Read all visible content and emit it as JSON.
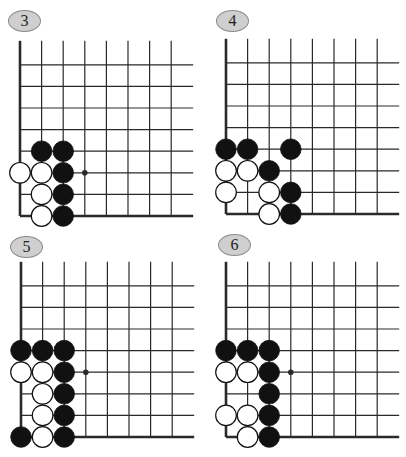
{
  "figure": {
    "grid": {
      "cols": 8,
      "rows": 8,
      "spacing": 21.6
    },
    "colors": {
      "line": "#2a2a2a",
      "badge_fill": "#cfcfcf",
      "badge_border": "#8a8a8a",
      "black_stone": "#111111",
      "white_stone": "#ffffff"
    },
    "boards": [
      {
        "label": "3",
        "origin": {
          "x": 20,
          "y": 216
        },
        "badge": {
          "x": 8,
          "y": 10
        },
        "star_points": [
          [
            3,
            2
          ]
        ],
        "stones": [
          {
            "c": 1,
            "r": 3,
            "color": "black"
          },
          {
            "c": 2,
            "r": 3,
            "color": "black"
          },
          {
            "c": 0,
            "r": 2,
            "color": "white"
          },
          {
            "c": 1,
            "r": 2,
            "color": "white"
          },
          {
            "c": 2,
            "r": 2,
            "color": "black"
          },
          {
            "c": 1,
            "r": 1,
            "color": "white"
          },
          {
            "c": 2,
            "r": 1,
            "color": "black"
          },
          {
            "c": 1,
            "r": 0.06,
            "color": "white",
            "rr": 1
          },
          {
            "c": 2,
            "r": 0.06,
            "color": "black",
            "rr": 1
          },
          {
            "c": 1,
            "r": 0,
            "color": "white"
          },
          {
            "c": 2,
            "r": 0,
            "color": "black"
          }
        ]
      },
      {
        "label": "4",
        "origin": {
          "x": 226,
          "y": 214
        },
        "badge": {
          "x": 216,
          "y": 10
        },
        "star_points": [],
        "stones": [
          {
            "c": 0,
            "r": 3,
            "color": "black"
          },
          {
            "c": 1,
            "r": 3,
            "color": "black"
          },
          {
            "c": 3,
            "r": 3,
            "color": "black"
          },
          {
            "c": 0,
            "r": 2,
            "color": "white"
          },
          {
            "c": 1,
            "r": 2,
            "color": "white"
          },
          {
            "c": 2,
            "r": 2,
            "color": "black"
          },
          {
            "c": 0,
            "r": 1,
            "color": "white"
          },
          {
            "c": 2,
            "r": 1,
            "color": "white"
          },
          {
            "c": 3,
            "r": 1,
            "color": "black"
          },
          {
            "c": 2,
            "r": 0,
            "color": "white"
          },
          {
            "c": 3,
            "r": 0,
            "color": "black"
          }
        ]
      },
      {
        "label": "5",
        "origin": {
          "x": 21,
          "y": 437
        },
        "badge": {
          "x": 10,
          "y": 236
        },
        "star_points": [
          [
            3,
            3
          ]
        ],
        "stones": [
          {
            "c": 0,
            "r": 4,
            "color": "black"
          },
          {
            "c": 1,
            "r": 4,
            "color": "black"
          },
          {
            "c": 2,
            "r": 4,
            "color": "black"
          },
          {
            "c": 0,
            "r": 3,
            "color": "white"
          },
          {
            "c": 1,
            "r": 3,
            "color": "white"
          },
          {
            "c": 2,
            "r": 3,
            "color": "black"
          },
          {
            "c": 1,
            "r": 2,
            "color": "white"
          },
          {
            "c": 2,
            "r": 2,
            "color": "black"
          },
          {
            "c": 1,
            "r": 1,
            "color": "white"
          },
          {
            "c": 2,
            "r": 1,
            "color": "black"
          },
          {
            "c": 0,
            "r": 0,
            "color": "black"
          },
          {
            "c": 1,
            "r": 0,
            "color": "white"
          },
          {
            "c": 2,
            "r": 0,
            "color": "black"
          }
        ]
      },
      {
        "label": "6",
        "origin": {
          "x": 226,
          "y": 437
        },
        "badge": {
          "x": 218,
          "y": 234
        },
        "star_points": [
          [
            3,
            3
          ]
        ],
        "stones": [
          {
            "c": 0,
            "r": 4,
            "color": "black"
          },
          {
            "c": 1,
            "r": 4,
            "color": "black"
          },
          {
            "c": 2,
            "r": 4,
            "color": "black"
          },
          {
            "c": 0,
            "r": 3,
            "color": "white"
          },
          {
            "c": 1,
            "r": 3,
            "color": "white"
          },
          {
            "c": 2,
            "r": 3,
            "color": "black"
          },
          {
            "c": 2,
            "r": 2,
            "color": "black"
          },
          {
            "c": 0,
            "r": 1,
            "color": "white"
          },
          {
            "c": 1,
            "r": 1,
            "color": "white"
          },
          {
            "c": 2,
            "r": 1,
            "color": "black"
          },
          {
            "c": 1,
            "r": 0,
            "color": "white"
          },
          {
            "c": 2,
            "r": 0,
            "color": "black"
          }
        ]
      }
    ]
  }
}
